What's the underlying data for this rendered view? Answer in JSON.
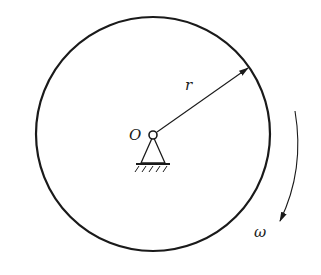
{
  "diagram": {
    "labels": {
      "center": "O",
      "radius": "r",
      "angular_velocity": "ω"
    },
    "rotation_direction": "clockwise",
    "colors": {
      "stroke": "#1a1a1a",
      "background": "#ffffff"
    }
  }
}
